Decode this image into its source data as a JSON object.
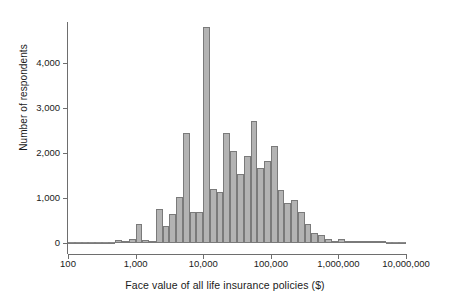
{
  "chart_data": {
    "type": "bar",
    "title": "",
    "subtitle": "",
    "xlabel": "Face value of all life insurance policies ($)",
    "ylabel": "Number of respondents",
    "xscale": "log",
    "xlim": [
      100,
      10000000
    ],
    "ylim": [
      0,
      4900
    ],
    "grid": false,
    "legend": null,
    "xtick_labels": [
      "100",
      "1,000",
      "10,000",
      "100,000",
      "1,000,000",
      "10,000,000"
    ],
    "xtick_values": [
      100,
      1000,
      10000,
      100000,
      1000000,
      10000000
    ],
    "ytick_labels": [
      "0",
      "1,000",
      "2,000",
      "3,000",
      "4,000"
    ],
    "ytick_values": [
      0,
      1000,
      2000,
      3000,
      4000
    ],
    "bins_per_decade": 10,
    "bin_left_edges": [
      100,
      125.9,
      158.5,
      199.5,
      251.2,
      316.2,
      398.1,
      501.2,
      631,
      794.3,
      1000,
      1259,
      1585,
      1995,
      2512,
      3162,
      3981,
      5012,
      6310,
      7943,
      10000,
      12590,
      15850,
      19950,
      25120,
      31620,
      39810,
      50120,
      63100,
      79430,
      100000,
      125900,
      158500,
      199500,
      251200,
      316200,
      398100,
      501200,
      631000,
      794300,
      1000000,
      1259000,
      1585000,
      1995000,
      2512000,
      3162000,
      3981000,
      5012000,
      6310000,
      7943000
    ],
    "values": [
      0,
      0,
      0,
      0,
      0,
      0,
      0,
      60,
      30,
      90,
      430,
      60,
      40,
      760,
      370,
      640,
      1020,
      2450,
      690,
      680,
      4790,
      1190,
      1120,
      2430,
      2040,
      1530,
      1940,
      2700,
      1670,
      1820,
      2150,
      1170,
      890,
      960,
      680,
      420,
      230,
      180,
      90,
      40,
      80,
      20,
      20,
      10,
      10,
      10,
      10,
      0,
      0,
      0
    ]
  }
}
